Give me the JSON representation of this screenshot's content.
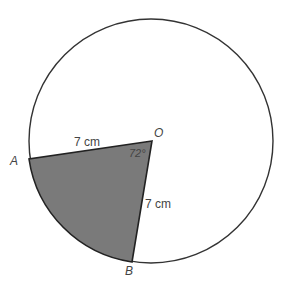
{
  "diagram": {
    "type": "circle-sector",
    "points": {
      "O": {
        "label": "O"
      },
      "A": {
        "label": "A"
      },
      "B": {
        "label": "B"
      }
    },
    "labels": {
      "OA_length": "7 cm",
      "OB_length": "7 cm",
      "angle_AOB": "72°"
    },
    "colors": {
      "sector_fill": "#7a7a7a",
      "stroke": "#222222",
      "background": "#ffffff"
    }
  }
}
